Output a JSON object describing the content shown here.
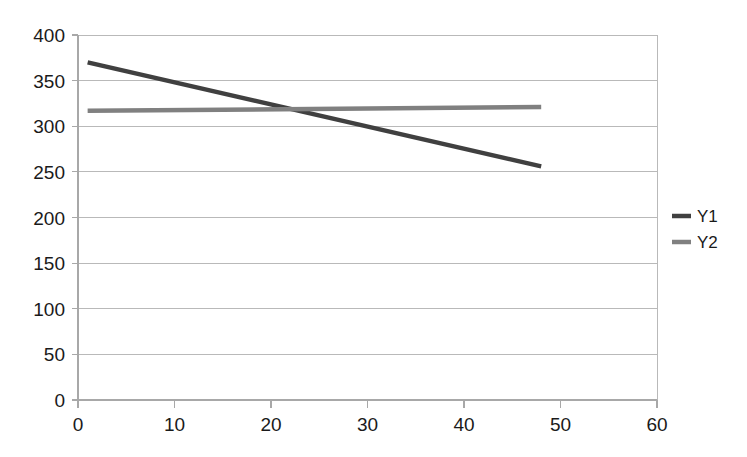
{
  "chart_data": {
    "type": "line",
    "title": "",
    "xlabel": "",
    "ylabel": "",
    "xlim": [
      0,
      60
    ],
    "ylim": [
      0,
      400
    ],
    "grid": true,
    "grid_axis": "y",
    "legend_position": "right",
    "x_ticks": [
      0,
      10,
      20,
      30,
      40,
      50,
      60
    ],
    "x_tick_labels": [
      "0",
      "10",
      "20",
      "30",
      "40",
      "50",
      "60"
    ],
    "y_ticks": [
      0,
      50,
      100,
      150,
      200,
      250,
      300,
      350,
      400
    ],
    "y_tick_labels": [
      "0",
      "50",
      "100",
      "150",
      "200",
      "250",
      "300",
      "350",
      "400"
    ],
    "series": [
      {
        "name": "Y1",
        "color": "#404040",
        "width": 4.5,
        "x": [
          1,
          48
        ],
        "values": [
          370,
          256
        ]
      },
      {
        "name": "Y2",
        "color": "#808080",
        "width": 4.5,
        "x": [
          1,
          48
        ],
        "values": [
          317,
          321
        ]
      }
    ],
    "legend": [
      {
        "label": "Y1",
        "color": "#404040"
      },
      {
        "label": "Y2",
        "color": "#808080"
      }
    ],
    "colors": {
      "background": "#ffffff",
      "gridline": "#b9b9b9",
      "axis": "#a8a8a8",
      "text": "#1a1a1a",
      "series_y1": "#404040",
      "series_y2": "#808080"
    }
  }
}
